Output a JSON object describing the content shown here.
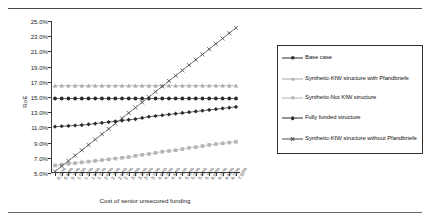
{
  "figure": {
    "top_rule": "horizontal-rule",
    "bottom_rule": "horizontal-rule"
  },
  "chart_data": {
    "type": "line",
    "title": "",
    "xlabel": "Cost of senior unsecured funding",
    "ylabel": "RoE",
    "grid": false,
    "legend_position": "right",
    "ylim": [
      5.0,
      25.0
    ],
    "ytick_labels": [
      "25.0%",
      "23.0%",
      "21.0%",
      "19.0%",
      "17.0%",
      "15.0%",
      "13.0%",
      "11.0%",
      "9.0%",
      "7.0%",
      "5.0%"
    ],
    "ytick_values": [
      25.0,
      23.0,
      21.0,
      19.0,
      17.0,
      15.0,
      13.0,
      11.0,
      9.0,
      7.0,
      5.0
    ],
    "xtick_labels": [
      "0.25%",
      "0.50%",
      "0.75%",
      "1.00%",
      "1.25%",
      "1.50%",
      "1.75%",
      "2.00%",
      "2.25%",
      "2.50%",
      "2.75%",
      "3.00%",
      "3.25%",
      "3.50%",
      "3.75%",
      "4.00%",
      "4.25%",
      "4.50%",
      "4.75%",
      "5.00%",
      "5.25%",
      "5.50%",
      "5.75%",
      "6.00%",
      "6.25%",
      "6.50%",
      "6.75%",
      "7.00%"
    ],
    "x": [
      0.25,
      0.5,
      0.75,
      1.0,
      1.25,
      1.5,
      1.75,
      2.0,
      2.25,
      2.5,
      2.75,
      3.0,
      3.25,
      3.5,
      3.75,
      4.0,
      4.25,
      4.5,
      4.75,
      5.0,
      5.25,
      5.5,
      5.75,
      6.0,
      6.25,
      6.5,
      6.75,
      7.0
    ],
    "series": [
      {
        "name": "Base case",
        "color": "#2b2b2b",
        "marker": "diamond",
        "values": [
          11.1,
          11.15,
          11.2,
          11.25,
          11.3,
          11.4,
          11.5,
          11.6,
          11.7,
          11.8,
          11.9,
          12.0,
          12.1,
          12.25,
          12.4,
          12.5,
          12.6,
          12.7,
          12.8,
          12.9,
          13.0,
          13.1,
          13.2,
          13.3,
          13.4,
          13.5,
          13.6,
          13.7
        ]
      },
      {
        "name": "Synthetic-KfW structure with Pfandbriefe",
        "color": "#a8a8a8",
        "marker": "triangle",
        "values": [
          16.5,
          16.5,
          16.5,
          16.5,
          16.5,
          16.5,
          16.5,
          16.5,
          16.5,
          16.5,
          16.5,
          16.5,
          16.5,
          16.5,
          16.5,
          16.5,
          16.5,
          16.5,
          16.5,
          16.5,
          16.5,
          16.5,
          16.5,
          16.5,
          16.5,
          16.5,
          16.5,
          16.5
        ]
      },
      {
        "name": "Synthetic-Not KfW structure",
        "color": "#b4b4b4",
        "marker": "square",
        "values": [
          6.0,
          6.1,
          6.2,
          6.3,
          6.4,
          6.5,
          6.6,
          6.7,
          6.8,
          6.9,
          7.0,
          7.1,
          7.25,
          7.4,
          7.5,
          7.65,
          7.8,
          7.9,
          8.0,
          8.15,
          8.3,
          8.4,
          8.55,
          8.7,
          8.8,
          8.9,
          9.0,
          9.1
        ]
      },
      {
        "name": "Fully funded structure",
        "color": "#2b2b2b",
        "marker": "circle",
        "values": [
          14.8,
          14.8,
          14.8,
          14.8,
          14.8,
          14.8,
          14.8,
          14.8,
          14.8,
          14.8,
          14.8,
          14.8,
          14.8,
          14.8,
          14.8,
          14.8,
          14.8,
          14.8,
          14.8,
          14.8,
          14.8,
          14.8,
          14.8,
          14.8,
          14.8,
          14.8,
          14.8,
          14.8
        ]
      },
      {
        "name": "Synthetic-KfW structure without Pfandbriefe",
        "color": "#4a4a4a",
        "marker": "cross",
        "values": [
          5.2,
          5.9,
          6.6,
          7.3,
          8.0,
          8.7,
          9.4,
          10.1,
          10.8,
          11.5,
          12.2,
          12.9,
          13.6,
          14.3,
          15.0,
          15.7,
          16.4,
          17.1,
          17.8,
          18.5,
          19.2,
          19.9,
          20.6,
          21.3,
          22.0,
          22.7,
          23.4,
          24.1
        ]
      }
    ]
  },
  "legend": {
    "items": [
      {
        "label": "Base case"
      },
      {
        "label": "Synthetic-KfW structure with Pfandbriefe"
      },
      {
        "label": "Synthetic-Not KfW structure"
      },
      {
        "label": "Fully funded structure"
      },
      {
        "label": "Synthetic-KfW structure without Pfandbriefe"
      }
    ]
  }
}
